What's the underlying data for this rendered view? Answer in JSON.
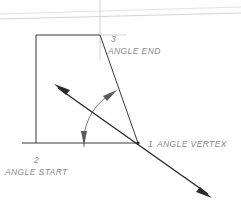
{
  "drawing": {
    "title": "Angle construction diagram",
    "background_color": "#fefefe",
    "line_color": "#3a3a3a",
    "ray_color": "#2b2b2b",
    "arc_color": "#6f6f6f",
    "label_color": "#8a8a8a",
    "aux_color": "#c9c9c9"
  },
  "labels": {
    "vertex": {
      "number": "1",
      "text": "ANGLE  VERTEX",
      "x": 148,
      "y": 146
    },
    "start": {
      "number": "2",
      "text": "ANGLE  START",
      "x": 6,
      "y": 175
    },
    "end": {
      "number": "3",
      "text": "ANGLE  END",
      "x": 110,
      "y": 45
    }
  },
  "points": {
    "vertex": {
      "id": "1",
      "name": "ANGLE VERTEX",
      "x": 138,
      "y": 143
    },
    "start": {
      "id": "2",
      "name": "ANGLE START",
      "x": 36,
      "y": 143
    },
    "end": {
      "id": "3",
      "name": "ANGLE END",
      "x": 100,
      "y": 35
    }
  },
  "geometry": {
    "quad_top_left": {
      "x": 36,
      "y": 35
    },
    "quad_top_right": {
      "x": 100,
      "y": 35
    },
    "quad_bottom_left": {
      "x": 36,
      "y": 143
    },
    "quad_bottom_right": {
      "x": 138,
      "y": 143
    },
    "baseline_left_extension_x": 22,
    "ray_arrow_start": {
      "x": 55,
      "y": 85
    },
    "ray_arrow_end": {
      "x": 211,
      "y": 197
    },
    "arc_radius": 55,
    "arc_start_angle_deg": 180,
    "arc_end_angle_deg": 227
  },
  "construction": {
    "vertical_line_x": 100,
    "vertical_line_top_y": 0,
    "vertical_line_bottom_y": 60,
    "horizontal_tick_y": 35,
    "horizontal_tick_x1": 100,
    "horizontal_tick_x2": 125,
    "scan_line_1_left_y": 14,
    "scan_line_1_right_y": 8,
    "scan_line_2_left_y": 18,
    "scan_line_2_right_y": 13
  }
}
